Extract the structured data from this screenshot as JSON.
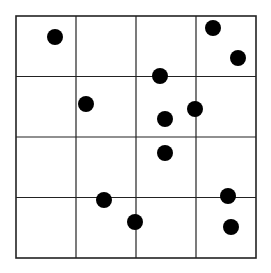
{
  "diagram": {
    "type": "quadrat-grid",
    "rows": 4,
    "cols": 4,
    "grid_box": {
      "left": 16,
      "top": 16,
      "right": 256,
      "bottom": 258
    },
    "line_color": "#222222",
    "dot_color": "#000000",
    "dot_radius": 8,
    "points": [
      {
        "x": 55,
        "y": 37
      },
      {
        "x": 213,
        "y": 28
      },
      {
        "x": 238,
        "y": 58
      },
      {
        "x": 160,
        "y": 76
      },
      {
        "x": 86,
        "y": 104
      },
      {
        "x": 195,
        "y": 109
      },
      {
        "x": 165,
        "y": 119
      },
      {
        "x": 165,
        "y": 153
      },
      {
        "x": 104,
        "y": 200
      },
      {
        "x": 228,
        "y": 196
      },
      {
        "x": 135,
        "y": 222
      },
      {
        "x": 231,
        "y": 227
      }
    ]
  }
}
